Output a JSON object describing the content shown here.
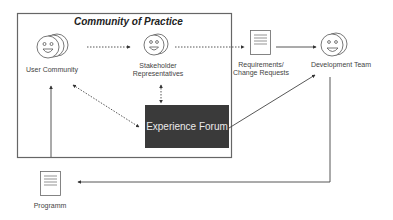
{
  "diagram": {
    "frame_title": "Community of Practice",
    "nodes": {
      "user_community": {
        "label": "User Community",
        "icon": "group-smiley-face-icon"
      },
      "stakeholders": {
        "label_line1": "Stakeholder",
        "label_line2": "Representatives",
        "icon": "smiley-face-icon"
      },
      "requirements": {
        "label_line1": "Requirements/",
        "label_line2": "Change Requests",
        "icon": "document-icon"
      },
      "development_team": {
        "label": "Development Team",
        "icon": "smiley-face-icon"
      },
      "experience_forum": {
        "label": "Experience Forum"
      },
      "programm": {
        "label": "Programm",
        "icon": "document-icon"
      }
    },
    "edges": [
      {
        "from": "User Community",
        "to": "Stakeholder Representatives",
        "style": "dotted"
      },
      {
        "from": "Stakeholder Representatives",
        "to": "Requirements/Change Requests",
        "style": "dotted"
      },
      {
        "from": "Requirements/Change Requests",
        "to": "Development Team",
        "style": "solid"
      },
      {
        "from": "Stakeholder Representatives",
        "to": "Experience Forum",
        "style": "dotted",
        "bidirectional": true
      },
      {
        "from": "User Community",
        "to": "Experience Forum",
        "style": "dotted",
        "bidirectional": true
      },
      {
        "from": "Experience Forum",
        "to": "Development Team",
        "style": "solid"
      },
      {
        "from": "Development Team",
        "to": "Programm",
        "style": "solid"
      },
      {
        "from": "Programm",
        "to": "User Community",
        "style": "solid"
      }
    ],
    "colors": {
      "frame": "#666666",
      "forum_bg": "#3a3a3a",
      "forum_text": "#eaeaea",
      "line": "#555555"
    }
  }
}
